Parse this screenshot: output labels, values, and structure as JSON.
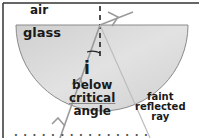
{
  "diagram": {
    "media": {
      "top": "air",
      "bottom": "glass"
    },
    "angle_label": "i",
    "angle_caption": [
      "below",
      "critical",
      "angle"
    ],
    "reflected_caption": [
      "faint",
      "reflected",
      "ray"
    ],
    "truncated_bottom_text": "· · · ·  · · · · · ·  · · · · ·",
    "colors": {
      "glass_fill": "#d4d4d4",
      "glass_edge": "#8a8a8a",
      "ray": "#9a9a9a",
      "frame": "#333333",
      "text": "#1a1a1a",
      "normal": "#222222"
    }
  }
}
